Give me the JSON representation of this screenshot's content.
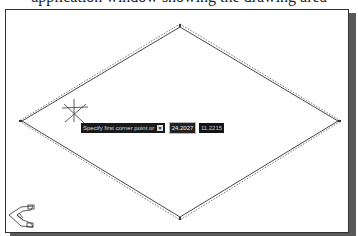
{
  "caption": {
    "text": "application window showing the drawing area"
  },
  "drawing": {
    "diamond": {
      "top": [
        179,
        25
      ],
      "right": [
        338,
        120
      ],
      "bottom": [
        179,
        217
      ],
      "left": [
        20,
        120
      ]
    },
    "line_color": "#333333",
    "dash_color": "#555555"
  },
  "cursor": {
    "x": 73,
    "y": 113
  },
  "dynamic_input": {
    "prompt": "Specify first corner point or",
    "options_icon": "down-arrow-icon",
    "options_glyph": "▼",
    "x_value": "24.2027",
    "y_value": "11.2215"
  },
  "ucs_icon": {
    "name": "ucs-icon"
  },
  "colors": {
    "background": "#ffffff",
    "frame": "#333333",
    "shadow": "#5a5a5a",
    "tooltip_bg": "#1a1a1a"
  }
}
